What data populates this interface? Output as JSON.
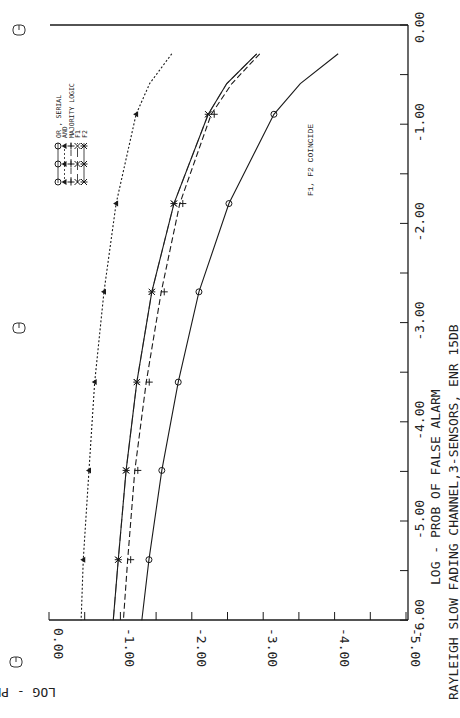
{
  "chart_data": {
    "type": "line",
    "orientation": "rotated-90-clockwise",
    "title": "RAYLEIGH SLOW FADING CHANNEL,3-SENSORS, ENR 15DB",
    "xlabel": "LOG - PROB OF FALSE ALARM",
    "ylabel": "LOG - PROB OF MISS",
    "xlim": [
      0.0,
      -6.0
    ],
    "ylim": [
      0.0,
      -5.0
    ],
    "x_ticks": [
      "0.00",
      "-1.00",
      "-2.00",
      "-3.00",
      "-4.00",
      "-5.00",
      "-6.00"
    ],
    "y_ticks": [
      "0.00",
      "-1.00",
      "-2.00",
      "-3.00",
      "-4.00",
      "-5.00"
    ],
    "grid": false,
    "legend_position": "upper-left (rotated)",
    "annotations": [
      "F1, F2 COINCIDE"
    ],
    "series": [
      {
        "name": "OR , SERIAL",
        "marker": "circle",
        "line": "solid",
        "x": [
          -0.29,
          -0.59,
          -0.9,
          -1.8,
          -2.69,
          -3.6,
          -4.49,
          -5.39,
          -6.0
        ],
        "y": [
          -4.05,
          -3.52,
          -3.15,
          -2.52,
          -2.1,
          -1.81,
          -1.58,
          -1.4,
          -1.3
        ],
        "markers_x": [
          -0.9,
          -1.8,
          -2.69,
          -3.6,
          -4.49,
          -5.39
        ]
      },
      {
        "name": "AND",
        "marker": "triangle",
        "line": "dotted",
        "x": [
          -0.29,
          -0.59,
          -0.9,
          -1.8,
          -2.69,
          -3.6,
          -4.49,
          -5.39,
          -6.0
        ],
        "y": [
          -1.72,
          -1.41,
          -1.22,
          -0.94,
          -0.77,
          -0.64,
          -0.56,
          -0.48,
          -0.45
        ],
        "markers_x": [
          -0.9,
          -1.8,
          -2.69,
          -3.6,
          -4.49,
          -5.39
        ]
      },
      {
        "name": "MAJORITY LOGIC",
        "marker": "plus",
        "line": "dashed",
        "x": [
          -0.29,
          -0.59,
          -0.9,
          -1.8,
          -2.69,
          -3.6,
          -4.49,
          -5.39,
          -6.0
        ],
        "y": [
          -2.91,
          -2.52,
          -2.23,
          -1.79,
          -1.53,
          -1.32,
          -1.16,
          -1.06,
          -1.0
        ],
        "markers_x": [
          -0.9,
          -1.8,
          -2.69,
          -3.6,
          -4.49,
          -5.39
        ]
      },
      {
        "name": "F1",
        "marker": "x",
        "line": "long-dash",
        "x": [
          -0.29,
          -0.59,
          -0.9,
          -1.8,
          -2.69,
          -3.6,
          -4.49,
          -5.39,
          -6.0
        ],
        "y": [
          -2.91,
          -2.49,
          -2.23,
          -1.75,
          -1.44,
          -1.23,
          -1.08,
          -0.97,
          -0.9
        ],
        "markers_x": [
          -0.9,
          -1.8,
          -2.69,
          -3.6,
          -4.49,
          -5.39
        ]
      },
      {
        "name": "F2",
        "marker": "star",
        "line": "solid",
        "x": [
          -0.29,
          -0.59,
          -0.9,
          -1.8,
          -2.69,
          -3.6,
          -4.49,
          -5.39,
          -6.0
        ],
        "y": [
          -2.91,
          -2.49,
          -2.23,
          -1.75,
          -1.44,
          -1.23,
          -1.08,
          -0.97,
          -0.9
        ],
        "markers_x": [
          -0.9,
          -1.8,
          -2.69,
          -3.6,
          -4.49,
          -5.39
        ]
      }
    ]
  },
  "legend": {
    "items": [
      {
        "label": "OR , SERIAL"
      },
      {
        "label": "AND"
      },
      {
        "label": "MAJORITY LOGIC"
      },
      {
        "label": "F1"
      },
      {
        "label": "F2"
      }
    ]
  },
  "annotation": "F1, F2 COINCIDE"
}
